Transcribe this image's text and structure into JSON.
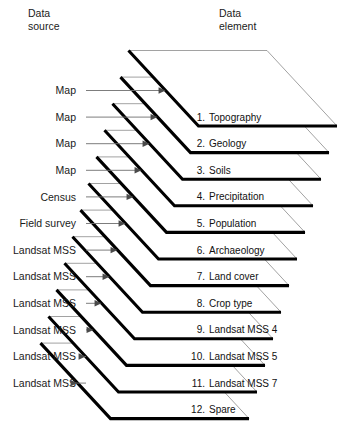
{
  "figure": {
    "headers": {
      "left_line1": "Data",
      "left_line2": "source",
      "right_line1": "Data",
      "right_line2": "element"
    },
    "layers": [
      {
        "number": "1.",
        "element": "Topography",
        "source": "Map"
      },
      {
        "number": "2.",
        "element": "Geology",
        "source": "Map"
      },
      {
        "number": "3.",
        "element": "Soils",
        "source": "Map"
      },
      {
        "number": "4.",
        "element": "Precipitation",
        "source": "Map"
      },
      {
        "number": "5.",
        "element": "Population",
        "source": "Census"
      },
      {
        "number": "6.",
        "element": "Archaeology",
        "source": "Field survey"
      },
      {
        "number": "7.",
        "element": "Land cover",
        "source": "Landsat MSS"
      },
      {
        "number": "8.",
        "element": "Crop type",
        "source": "Landsat MSS"
      },
      {
        "number": "9.",
        "element": "Landsat MSS 4",
        "source": "Landsat MSS"
      },
      {
        "number": "10.",
        "element": "Landsat MSS 5",
        "source": "Landsat MSS"
      },
      {
        "number": "11.",
        "element": "Landsat MSS 7",
        "source": "Landsat MSS"
      },
      {
        "number": "12.",
        "element": "Spare",
        "source": "Landsat MSS"
      }
    ],
    "colors": {
      "background": "#ffffff",
      "thick_edge": "#000000",
      "thin_edge": "#8a8a8a",
      "text": "#111111",
      "arrow": "#6e6e6e"
    }
  }
}
